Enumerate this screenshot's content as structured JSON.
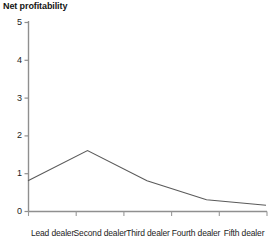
{
  "chart_data": {
    "type": "line",
    "title": "Net profitability",
    "xlabel": "",
    "ylabel": "",
    "categories": [
      "Lead dealer",
      "Second dealer",
      "Third dealer",
      "Fourth dealer",
      "Fifth dealer"
    ],
    "values": [
      0.8,
      1.6,
      0.8,
      0.3,
      0.15
    ],
    "series": [
      {
        "name": "Net profitability",
        "values": [
          0.8,
          1.6,
          0.8,
          0.3,
          0.15
        ]
      }
    ],
    "ylim": [
      0,
      5
    ],
    "yticks": [
      0,
      1,
      2,
      3,
      4,
      5
    ],
    "ytick_labels": [
      "0",
      "1",
      "2",
      "3",
      "4",
      "5"
    ],
    "grid": false,
    "legend": false,
    "legend_position": "none",
    "line_color": "#5a5a5a",
    "axis_color": "#8a8a8a",
    "background": "#ffffff"
  }
}
